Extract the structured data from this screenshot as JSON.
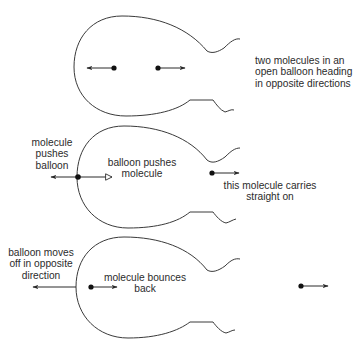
{
  "panels": [
    {
      "id": "panel-1",
      "caption": [
        "two molecules in an",
        "open balloon heading",
        "in opposite directions"
      ]
    },
    {
      "id": "panel-2",
      "labels": {
        "molecule_pushes_balloon": [
          "molecule",
          "pushes",
          "balloon"
        ],
        "balloon_pushes_molecule": [
          "balloon pushes",
          "molecule"
        ],
        "molecule_carries_on": [
          "this molecule carries",
          "straight on"
        ]
      }
    },
    {
      "id": "panel-3",
      "labels": {
        "balloon_moves_off": [
          "balloon moves",
          "off in opposite",
          "direction"
        ],
        "molecule_bounces_back": [
          "molecule bounces",
          "back"
        ]
      }
    }
  ],
  "colors": {
    "line": "#3a3a3a",
    "dot": "#111111",
    "text": "#2b2b2b",
    "background": "#ffffff"
  },
  "icons": {
    "molecule": "filled-dot",
    "arrow": "solid-arrowhead",
    "force_arrow": "open-arrowhead"
  }
}
